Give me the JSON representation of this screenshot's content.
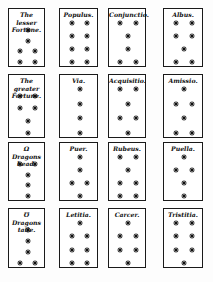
{
  "document": {
    "subject": "Geomantic figures",
    "cards": [
      {
        "title": "The lesser\nFortune.",
        "rows": [
          [
            1
          ],
          [
            1
          ],
          [
            1,
            1
          ],
          [
            1,
            1
          ]
        ],
        "star_count": 6
      },
      {
        "title": "Populus.",
        "rows": [
          [
            1,
            1
          ],
          [
            1,
            1
          ],
          [
            1,
            1
          ],
          [
            1,
            1
          ]
        ],
        "star_count": 8
      },
      {
        "title": "Conjunctio.",
        "rows": [
          [
            1,
            1
          ],
          [
            1
          ],
          [
            1
          ],
          [
            1,
            1
          ]
        ],
        "star_count": 6
      },
      {
        "title": "Albus.",
        "rows": [
          [
            1,
            1
          ],
          [
            1,
            1
          ],
          [
            1
          ],
          [
            1,
            1
          ]
        ],
        "star_count": 7
      },
      {
        "title": "The greater\nFortune.",
        "rows": [
          [
            1,
            1
          ],
          [
            1,
            1
          ],
          [
            1
          ],
          [
            1
          ]
        ],
        "star_count": 6
      },
      {
        "title": "Via.",
        "rows": [
          [
            1
          ],
          [
            1
          ],
          [
            1
          ],
          [
            1
          ]
        ],
        "star_count": 4
      },
      {
        "title": "Acquisitio.",
        "rows": [
          [
            1,
            1
          ],
          [
            1
          ],
          [
            1,
            1
          ],
          [
            1
          ]
        ],
        "star_count": 6
      },
      {
        "title": "Amissio.",
        "rows": [
          [
            1
          ],
          [
            1,
            1
          ],
          [
            1
          ],
          [
            1,
            1
          ]
        ],
        "star_count": 6
      },
      {
        "title": "Ω Dragons\nhead.",
        "rows": [
          [
            1,
            1
          ],
          [
            1
          ],
          [
            1
          ],
          [
            1
          ]
        ],
        "star_count": 5
      },
      {
        "title": "Puer.",
        "rows": [
          [
            1
          ],
          [
            1
          ],
          [
            1,
            1
          ],
          [
            1
          ]
        ],
        "star_count": 5
      },
      {
        "title": "Rubeus.",
        "rows": [
          [
            1,
            1
          ],
          [
            1
          ],
          [
            1,
            1
          ],
          [
            1,
            1
          ]
        ],
        "star_count": 7
      },
      {
        "title": "Puella.",
        "rows": [
          [
            1
          ],
          [
            1,
            1
          ],
          [
            1
          ],
          [
            1
          ]
        ],
        "star_count": 5
      },
      {
        "title": "℧ Dragons\ntaile.",
        "rows": [
          [
            1
          ],
          [
            1
          ],
          [
            1
          ],
          [
            1,
            1
          ]
        ],
        "star_count": 5
      },
      {
        "title": "Letitia.",
        "rows": [
          [
            1
          ],
          [
            1,
            1
          ],
          [
            1,
            1
          ],
          [
            1,
            1
          ]
        ],
        "star_count": 7
      },
      {
        "title": "Carcer.",
        "rows": [
          [
            1
          ],
          [
            1,
            1
          ],
          [
            1,
            1
          ],
          [
            1
          ]
        ],
        "star_count": 6
      },
      {
        "title": "Tristitia.",
        "rows": [
          [
            1,
            1
          ],
          [
            1,
            1
          ],
          [
            1,
            1
          ],
          [
            1
          ]
        ],
        "star_count": 7
      }
    ]
  },
  "colors": {
    "ink": "#111111",
    "paper": "#ffffff"
  }
}
